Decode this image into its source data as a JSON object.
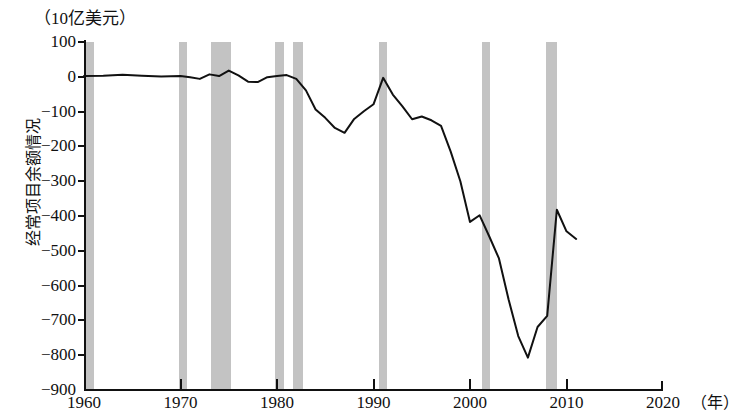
{
  "chart_data": {
    "type": "line",
    "title": "",
    "unit_label": "（10亿美元）",
    "ylabel": "经常项目余额情况",
    "xlabel": "（年）",
    "xlim": [
      1960,
      2020
    ],
    "ylim": [
      -900,
      100
    ],
    "grid": false,
    "legend": "none",
    "ytick_labels": [
      "100",
      "0",
      "−100",
      "−200",
      "−300",
      "−400",
      "−500",
      "−600",
      "−700",
      "−800",
      "−900"
    ],
    "ytick_values": [
      100,
      0,
      -100,
      -200,
      -300,
      -400,
      -500,
      -600,
      -700,
      -800,
      -900
    ],
    "xtick_labels": [
      "1960",
      "1970",
      "1980",
      "1990",
      "2000",
      "2010",
      "2020"
    ],
    "xtick_values": [
      1960,
      1970,
      1980,
      1990,
      2000,
      2010,
      2020
    ],
    "series": [
      {
        "name": "经常项目余额情况",
        "color": "#111111",
        "x": [
          1960,
          1962,
          1964,
          1966,
          1968,
          1970,
          1971,
          1972,
          1973,
          1974,
          1975,
          1976,
          1977,
          1978,
          1979,
          1980,
          1981,
          1982,
          1983,
          1984,
          1985,
          1986,
          1987,
          1988,
          1989,
          1990,
          1991,
          1992,
          1993,
          1994,
          1995,
          1996,
          1997,
          1998,
          1999,
          2000,
          2001,
          2002,
          2003,
          2004,
          2005,
          2006,
          2007,
          2008,
          2009,
          2010,
          2011
        ],
        "values": [
          2,
          3,
          6,
          3,
          1,
          2,
          -1,
          -6,
          7,
          2,
          18,
          4,
          -14,
          -15,
          -1,
          2,
          5,
          -6,
          -39,
          -94,
          -118,
          -147,
          -161,
          -121,
          -99,
          -79,
          -3,
          -51,
          -85,
          -122,
          -114,
          -125,
          -141,
          -215,
          -300,
          -417,
          -398,
          -459,
          -522,
          -640,
          -745,
          -807,
          -719,
          -687,
          -382,
          -444,
          -466
        ],
        "marker": "none",
        "linewidth": 2
      }
    ],
    "recession_bands": [
      {
        "start": 1960.0,
        "end": 1961.0,
        "label": "1960–61 recession"
      },
      {
        "start": 1969.8,
        "end": 1970.7,
        "label": "1969–70 recession"
      },
      {
        "start": 1973.2,
        "end": 1975.2,
        "label": "1973–75 recession"
      },
      {
        "start": 1979.8,
        "end": 1980.7,
        "label": "1980 recession"
      },
      {
        "start": 1981.7,
        "end": 1982.7,
        "label": "1981–82 recession"
      },
      {
        "start": 1990.6,
        "end": 1991.4,
        "label": "1990–91 recession"
      },
      {
        "start": 2001.2,
        "end": 2001.9,
        "label": "2001 recession"
      },
      {
        "start": 2007.9,
        "end": 2009.0,
        "label": "2007–09 recession"
      }
    ],
    "band_color": "#c3c3c3",
    "background_color": "#ffffff",
    "axis_color": "#111111"
  }
}
